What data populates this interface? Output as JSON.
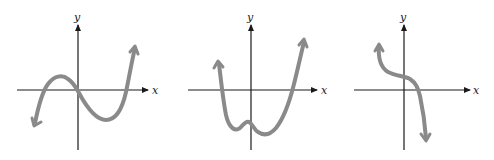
{
  "graphs": [
    {
      "id": "graph-1",
      "description": "cubic with positive leading coefficient, three real zeros, one through origin",
      "x_label": "x",
      "y_label": "y",
      "curve_color": "#8a8a8a"
    },
    {
      "id": "graph-2",
      "description": "quartic with positive leading coefficient, two real zeros, W-like bottom with small local max near y-axis",
      "x_label": "x",
      "y_label": "y",
      "curve_color": "#8a8a8a"
    },
    {
      "id": "graph-3",
      "description": "cubic with negative leading coefficient, single real zero, inflection near y-axis",
      "x_label": "x",
      "y_label": "y",
      "curve_color": "#8a8a8a"
    }
  ]
}
